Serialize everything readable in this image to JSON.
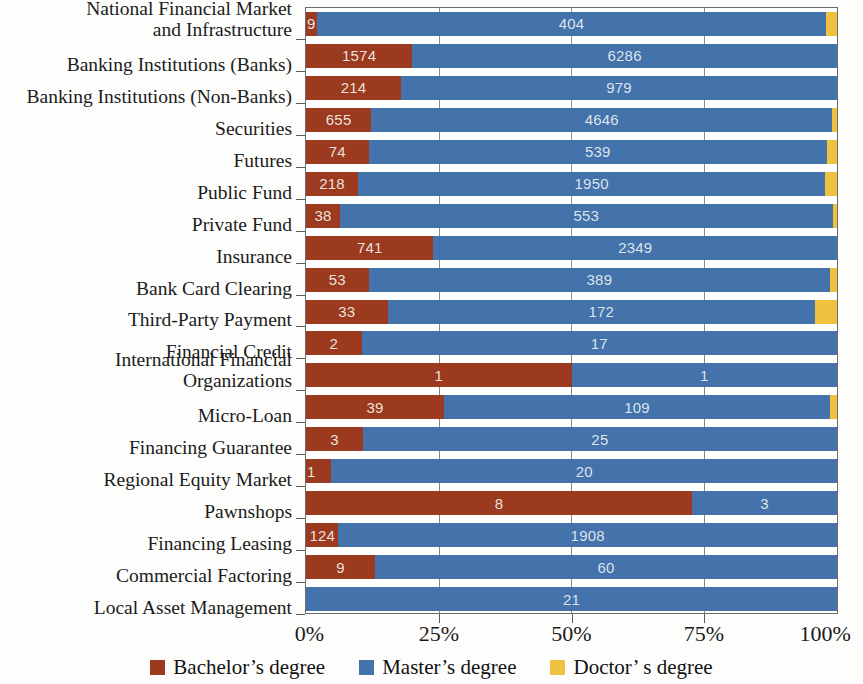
{
  "chart_data": {
    "type": "bar",
    "orientation": "horizontal",
    "stacked": true,
    "normalized": true,
    "title": "",
    "xlabel": "",
    "ylabel": "",
    "xlim": [
      0,
      100
    ],
    "xticks": [
      "0%",
      "25%",
      "50%",
      "75%",
      "100%"
    ],
    "xtick_values": [
      0,
      25,
      50,
      75,
      100
    ],
    "grid": true,
    "legend_position": "bottom",
    "categories": [
      "National Financial Market\nand Infrastructure",
      "Banking Institutions (Banks)",
      "Banking Institutions (Non-Banks)",
      "Securities",
      "Futures",
      "Public Fund",
      "Private Fund",
      "Insurance",
      "Bank Card Clearing",
      "Third-Party Payment",
      "Financial Credit",
      "International Financial\nOrganizations",
      "Micro-Loan",
      "Financing Guarantee",
      "Regional Equity Market",
      "Pawnshops",
      "Financing Leasing",
      "Commercial Factoring",
      "Local Asset Management"
    ],
    "series": [
      {
        "name": "Bachelor's degree",
        "color": "#9c3a20",
        "values": [
          9,
          1574,
          214,
          655,
          74,
          218,
          38,
          741,
          53,
          33,
          2,
          1,
          39,
          3,
          1,
          8,
          124,
          9,
          0
        ]
      },
      {
        "name": "Master's degree",
        "color": "#4473ac",
        "values": [
          404,
          6286,
          979,
          4646,
          539,
          1950,
          553,
          2349,
          389,
          172,
          17,
          1,
          109,
          25,
          20,
          3,
          1908,
          60,
          21
        ]
      },
      {
        "name": "Doctor's degree",
        "color": "#efc240",
        "values": [
          9,
          0,
          0,
          46,
          12,
          48,
          5,
          0,
          6,
          9,
          0,
          0,
          2,
          0,
          0,
          0,
          0,
          0,
          0
        ]
      }
    ],
    "bar_percent_layout": [
      {
        "b": 2.1,
        "m": 95.8,
        "d": 2.1
      },
      {
        "b": 20.0,
        "m": 80.0,
        "d": 0.0
      },
      {
        "b": 17.9,
        "m": 82.1,
        "d": 0.0
      },
      {
        "b": 12.3,
        "m": 86.8,
        "d": 0.9
      },
      {
        "b": 11.8,
        "m": 86.3,
        "d": 1.9
      },
      {
        "b": 9.8,
        "m": 88.0,
        "d": 2.2
      },
      {
        "b": 6.4,
        "m": 92.8,
        "d": 0.8
      },
      {
        "b": 24.0,
        "m": 76.0,
        "d": 0.0
      },
      {
        "b": 11.8,
        "m": 86.9,
        "d": 1.3
      },
      {
        "b": 15.4,
        "m": 80.4,
        "d": 4.2
      },
      {
        "b": 10.5,
        "m": 89.5,
        "d": 0.0
      },
      {
        "b": 50.0,
        "m": 50.0,
        "d": 0.0
      },
      {
        "b": 26.0,
        "m": 72.7,
        "d": 1.3
      },
      {
        "b": 10.7,
        "m": 89.3,
        "d": 0.0
      },
      {
        "b": 4.8,
        "m": 95.2,
        "d": 0.0
      },
      {
        "b": 72.7,
        "m": 27.3,
        "d": 0.0
      },
      {
        "b": 6.1,
        "m": 93.9,
        "d": 0.0
      },
      {
        "b": 13.0,
        "m": 87.0,
        "d": 0.0
      },
      {
        "b": 0.0,
        "m": 100.0,
        "d": 0.0
      }
    ],
    "data_labels": {
      "bachelor": [
        "9",
        "1574",
        "214",
        "655",
        "74",
        "218",
        "38",
        "741",
        "53",
        "33",
        "2",
        "1",
        "39",
        "3",
        "1",
        "8",
        "124",
        "9",
        ""
      ],
      "master": [
        "404",
        "6286",
        "979",
        "4646",
        "539",
        "1950",
        "553",
        "2349",
        "389",
        "172",
        "17",
        "1",
        "109",
        "25",
        "20",
        "3",
        "1908",
        "60",
        "21"
      ],
      "doctor": [
        "",
        "",
        "",
        "",
        "",
        "",
        "",
        "",
        "",
        "",
        "",
        "",
        "",
        "",
        "",
        "",
        "",
        "",
        ""
      ]
    }
  },
  "legend": {
    "items": [
      {
        "label": "Bachelor’s degree",
        "color": "#9c3a20"
      },
      {
        "label": "Master’s degree",
        "color": "#4473ac"
      },
      {
        "label": "Doctor’ s degree",
        "color": "#efc240"
      }
    ]
  },
  "colors": {
    "bachelor": "#9c3a20",
    "master": "#4473ac",
    "doctor": "#efc240",
    "axis": "#5d5d5d",
    "grid": "#8a8a8a",
    "background": "#fdfdfb"
  }
}
